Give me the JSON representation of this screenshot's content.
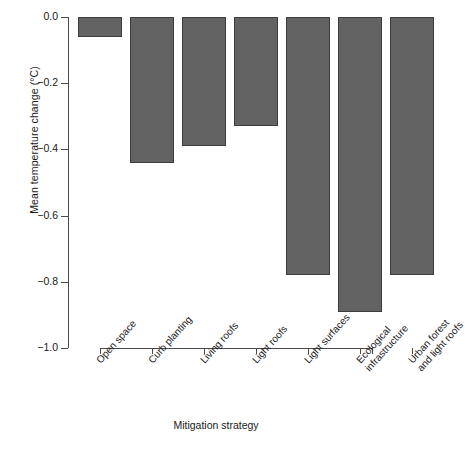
{
  "chart_data": {
    "type": "bar",
    "title": "",
    "xlabel": "Mitigation strategy",
    "ylabel": "Mean temperature change (°C)",
    "categories": [
      "Open space",
      "Curb planting",
      "Living roofs",
      "Light roofs",
      "Light surfaces",
      "Ecological infrastructure",
      "Urban forest and light roofs"
    ],
    "category_lines": [
      [
        "Open space"
      ],
      [
        "Curb planting"
      ],
      [
        "Living roofs"
      ],
      [
        "Light roofs"
      ],
      [
        "Light surfaces"
      ],
      [
        "Ecological",
        "infrastructure"
      ],
      [
        "Urban forest",
        "and light roofs"
      ]
    ],
    "values": [
      -0.06,
      -0.44,
      -0.39,
      -0.33,
      -0.78,
      -0.89,
      -0.78
    ],
    "ylim": [
      -1.0,
      0.0
    ],
    "yticks": [
      0.0,
      -0.2,
      -0.4,
      -0.6,
      -0.8,
      -1.0
    ],
    "ytick_labels": [
      "0.0",
      "−0.2",
      "−0.4",
      "−0.6",
      "−0.8",
      "−1.0"
    ],
    "grid": false,
    "legend": null,
    "bar_color": "#636363",
    "bar_edge_color": "#3d3d3d",
    "axis_color": "#4a4a4a"
  }
}
